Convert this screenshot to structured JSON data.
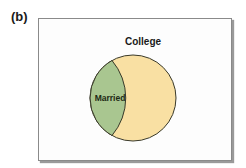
{
  "panel_label": "(b)",
  "diagram": {
    "type": "venn",
    "outer_set": {
      "label": "College",
      "color": "#f9e0a3"
    },
    "inner_set": {
      "label": "Married",
      "color": "#a9c690"
    },
    "outline_color": "#3a3a2a"
  }
}
